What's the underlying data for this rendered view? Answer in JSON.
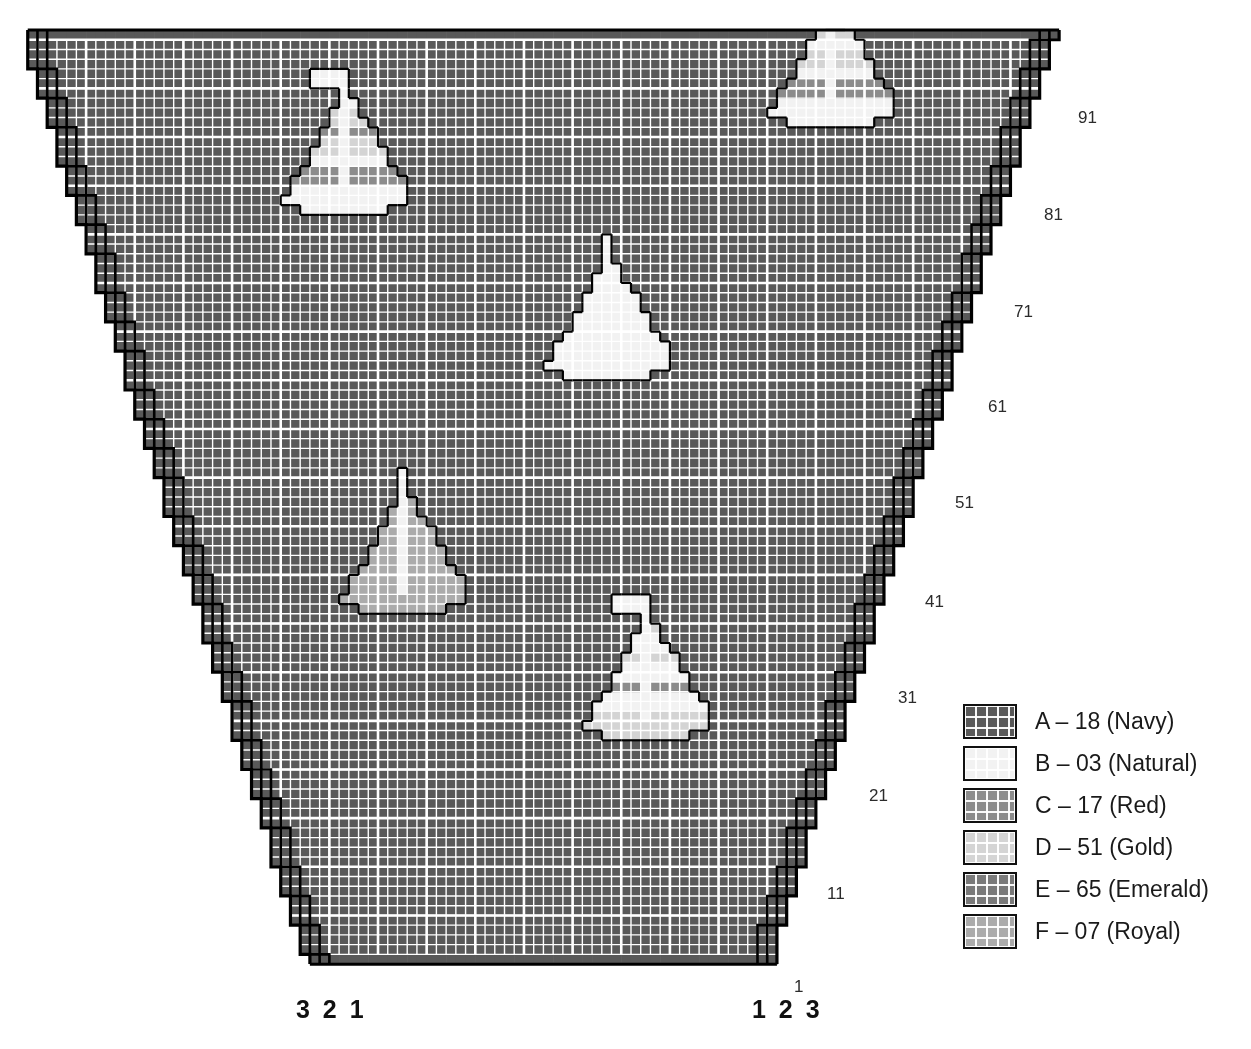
{
  "title": "SLEEVES",
  "chart_data": {
    "type": "table",
    "title": "SLEEVES",
    "grid": {
      "cell_px": 10,
      "bold_every": 5,
      "columns_total": 107,
      "rows_total": 96,
      "background_symbol": "A"
    },
    "row_labels": [
      "1",
      "11",
      "21",
      "31",
      "41",
      "51",
      "61",
      "71",
      "81",
      "91"
    ],
    "row_label_positions_y": [
      977,
      884,
      786,
      688,
      592,
      493,
      397,
      302,
      205,
      108
    ],
    "row_label_positions_x": [
      794,
      827,
      869,
      898,
      925,
      955,
      988,
      1014,
      1044,
      1078
    ],
    "column_label_left": "3 2 1",
    "column_label_right": "1 2 3",
    "shape": {
      "kind": "tapered-sleeve",
      "bottom_width_stitches": 48,
      "top_width_stitches": 106,
      "rows": 96,
      "selvedge_lines": 3,
      "note": "Both side edges increase in stair-steps; three heavy outline lines mark stitches 1, 2 and 3 from each edge."
    },
    "motifs": [
      {
        "name": "sailboat-top-left",
        "center_col": 33,
        "center_row": 79,
        "style": "striped",
        "has_flag": true,
        "bands_top_to_bottom": [
          "B",
          "D",
          "C",
          "D",
          "B",
          "C",
          "B"
        ]
      },
      {
        "name": "sailboat-top-right",
        "center_col": 83,
        "center_row": 88,
        "style": "striped",
        "has_flag": true,
        "bands_top_to_bottom": [
          "B",
          "D",
          "B",
          "D",
          "B",
          "C",
          "B"
        ]
      },
      {
        "name": "sailboat-center",
        "center_col": 60,
        "center_row": 62,
        "style": "solid",
        "has_flag": false,
        "color": "B"
      },
      {
        "name": "sailboat-lower-left",
        "center_col": 39,
        "center_row": 38,
        "style": "solid",
        "has_flag": false,
        "color": "F"
      },
      {
        "name": "sailboat-bottom-center",
        "center_col": 64,
        "center_row": 25,
        "style": "striped",
        "has_flag": true,
        "bands_top_to_bottom": [
          "D",
          "B",
          "D",
          "B",
          "C",
          "B",
          "D"
        ]
      }
    ]
  },
  "legend": {
    "items": [
      {
        "key": "A",
        "label": "A – 18 (Navy)",
        "color": "#595959"
      },
      {
        "key": "B",
        "label": "B – 03 (Natural)",
        "color": "#f2f2f2"
      },
      {
        "key": "C",
        "label": "C – 17 (Red)",
        "color": "#8c8c8c"
      },
      {
        "key": "D",
        "label": "D – 51 (Gold)",
        "color": "#d4d4d4"
      },
      {
        "key": "E",
        "label": "E – 65 (Emerald)",
        "color": "#7a7a7a"
      },
      {
        "key": "F",
        "label": "F – 07 (Royal)",
        "color": "#ababab"
      }
    ]
  },
  "axis": {
    "row_labels": [
      "1",
      "11",
      "21",
      "31",
      "41",
      "51",
      "61",
      "71",
      "81",
      "91"
    ],
    "column_left": "3 2 1",
    "column_right": "1 2 3"
  }
}
